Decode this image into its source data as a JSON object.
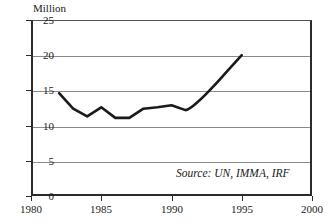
{
  "chart_data": {
    "type": "line",
    "title": "",
    "subtitle": "",
    "xlabel": "",
    "ylabel": "Million",
    "unit_label": "Million",
    "xlim": [
      1980,
      2000
    ],
    "ylim": [
      0,
      25
    ],
    "grid": true,
    "legend": null,
    "x_ticks": [
      "1980",
      "1985",
      "1990",
      "1995",
      "2000"
    ],
    "x_tick_values": [
      1980,
      1985,
      1990,
      1995,
      2000
    ],
    "y_ticks": [
      "0",
      "5",
      "10",
      "15",
      "20",
      "25"
    ],
    "y_tick_values": [
      0,
      5,
      10,
      15,
      20,
      25
    ],
    "x": [
      1982,
      1983,
      1984,
      1985,
      1986,
      1987,
      1988,
      1989,
      1990,
      1991,
      1992,
      1993,
      1994,
      1995
    ],
    "series": [
      {
        "name": "Million",
        "values": [
          14.6,
          12.4,
          11.3,
          12.6,
          11.1,
          11.1,
          12.4,
          12.6,
          12.9,
          12.2,
          13.6,
          15.6,
          17.8,
          20.0
        ]
      }
    ],
    "annotations": [
      {
        "text": "Source: UN, IMMA, IRF",
        "style": "italic",
        "position": "bottom-right-inside"
      }
    ],
    "line_color": "#1a1a1a",
    "grid_color": "#8a8a8a",
    "axis_color": "#2b2b2b",
    "background_color": "#ffffff"
  },
  "source_note": "Source: UN, IMMA, IRF"
}
